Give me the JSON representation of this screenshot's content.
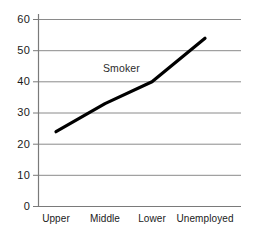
{
  "chart_data": {
    "type": "line",
    "title": "",
    "subtitle": "",
    "xlabel": "",
    "ylabel": "",
    "categories": [
      "Upper",
      "Middle",
      "Lower",
      "Unemployed"
    ],
    "series": [
      {
        "name": "Smoker",
        "values": [
          24,
          33,
          40,
          54
        ]
      }
    ],
    "annotations": [
      {
        "text": "Smoker",
        "series": "Smoker"
      }
    ],
    "ylim": [
      0,
      60
    ],
    "ytick_labels": [
      "0",
      "10",
      "20",
      "30",
      "40",
      "50",
      "60"
    ],
    "ytick_values": [
      0,
      10,
      20,
      30,
      40,
      50,
      60
    ],
    "grid": true,
    "grid_axis": "y",
    "legend": false,
    "legend_position": "none",
    "colors": {
      "line": "#000000",
      "grid": "#8a8a8a",
      "axis": "#7a7a7a",
      "text": "#1a1a1a",
      "background": "#ffffff"
    }
  }
}
